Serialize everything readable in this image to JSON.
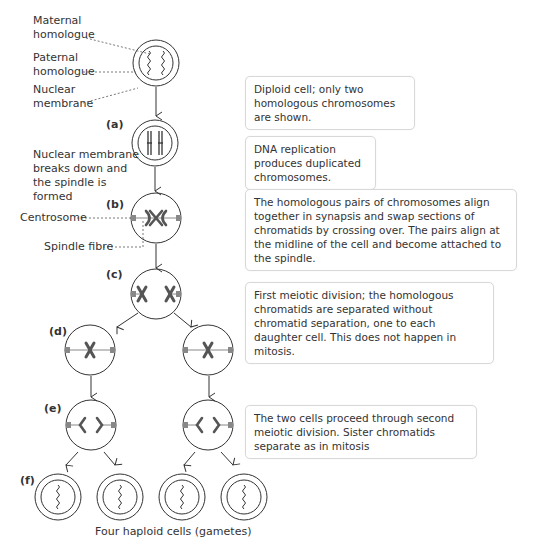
{
  "labels": {
    "maternal": "Maternal\nhomologue",
    "maternal_1": "Maternal",
    "maternal_2": "homologue",
    "paternal_1": "Paternal",
    "paternal_2": "homologue",
    "nuclear_1": "Nuclear",
    "nuclear_2": "membrane",
    "breakdown_1": "Nuclear membrane",
    "breakdown_2": "breaks down and",
    "breakdown_3": "the spindle is",
    "breakdown_4": "formed",
    "centrosome": "Centrosome",
    "spindle_fibre": "Spindle fibre"
  },
  "stages": {
    "a": "(a)",
    "b": "(b)",
    "c": "(c)",
    "d": "(d)",
    "e": "(e)",
    "f": "(f)"
  },
  "boxes": [
    {
      "text": "Diploid cell; only two homologous chromosomes are shown."
    },
    {
      "text": "DNA replication produces duplicated chromosomes."
    },
    {
      "text": "The homologous pairs of chromosomes align together in synapsis and swap sections of chromatids by crossing over. The pairs align at the midline of the cell and become attached to the spindle."
    },
    {
      "text": "First meiotic division; the homologous chromatids are separated without chromatid separation, one to each daughter cell. This does not happen in mitosis."
    },
    {
      "text": "The two cells proceed through second meiotic division. Sister chromatids separate as in mitosis"
    }
  ],
  "caption": "Four haploid cells (gametes)",
  "colors": {
    "line": "#333333",
    "chromosome": "#555555",
    "centrosome": "#888888",
    "box_border": "#d8d8d8"
  }
}
